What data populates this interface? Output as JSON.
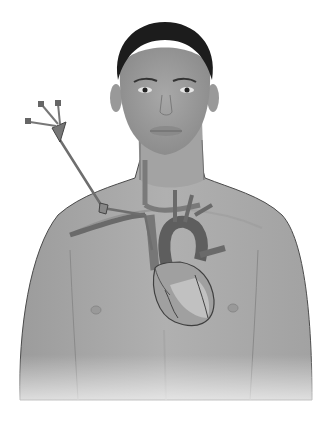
{
  "figure": {
    "colors": {
      "background": "#ffffff",
      "skin": "#a9a9a9",
      "skin_shadow": "#8e8e8e",
      "skin_light": "#bdbdbd",
      "hair": "#1c1c1c",
      "outline": "#4a4a4a",
      "vessel": "#7a7a7a",
      "vessel_dark": "#555555",
      "heart": "#9a9a9a",
      "heart_light": "#cfcfcf",
      "catheter": "#6e6e6e"
    },
    "parts": {
      "catheter_lumens": 3
    }
  }
}
